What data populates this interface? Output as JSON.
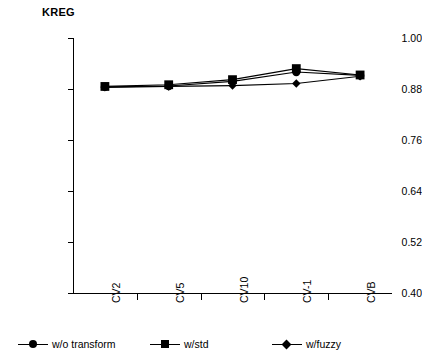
{
  "chart_data": {
    "type": "line",
    "title": "KREG",
    "xlabel": "",
    "ylabel": "",
    "categories": [
      "CV2",
      "CV5",
      "CV10",
      "CV-1",
      "CVB"
    ],
    "yticks": [
      "1.00",
      "0.88",
      "0.76",
      "0.64",
      "0.52",
      "0.40"
    ],
    "ytick_values": [
      1.0,
      0.88,
      0.76,
      0.64,
      0.52,
      0.4
    ],
    "ylim": [
      0.4,
      1.0
    ],
    "grid": false,
    "legend_position": "bottom",
    "series": [
      {
        "name": "w/o transform",
        "marker": "circle",
        "values": [
          0.885,
          0.887,
          0.898,
          0.92,
          0.912
        ]
      },
      {
        "name": "w/std",
        "marker": "square",
        "values": [
          0.886,
          0.89,
          0.902,
          0.928,
          0.913
        ]
      },
      {
        "name": "w/fuzzy",
        "marker": "diamond",
        "values": [
          0.884,
          0.886,
          0.888,
          0.893,
          0.91
        ]
      }
    ]
  },
  "legend": {
    "entries": [
      {
        "label": "w/o transform",
        "marker": "circle-marker-icon"
      },
      {
        "label": "w/std",
        "marker": "square-marker-icon"
      },
      {
        "label": "w/fuzzy",
        "marker": "diamond-marker-icon"
      }
    ]
  },
  "colors": {
    "line": "#000000",
    "marker": "#000000",
    "axis": "#000000",
    "background": "#ffffff"
  }
}
